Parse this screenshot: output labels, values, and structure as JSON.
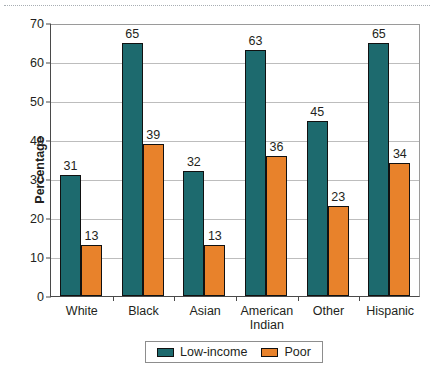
{
  "chart_data": {
    "type": "bar",
    "title": "",
    "xlabel": "",
    "ylabel": "Percentage",
    "ylim": [
      0,
      70
    ],
    "ytick_step": 10,
    "yticks": [
      0,
      10,
      20,
      30,
      40,
      50,
      60,
      70
    ],
    "grid": true,
    "legend_position": "bottom",
    "categories": [
      "White",
      "Black",
      "Asian",
      "American\nIndian",
      "Other",
      "Hispanic"
    ],
    "series": [
      {
        "name": "Low-income",
        "color": "#1d6a6e",
        "values": [
          31,
          65,
          32,
          63,
          45,
          65
        ]
      },
      {
        "name": "Poor",
        "color": "#e8822b",
        "values": [
          13,
          39,
          13,
          36,
          23,
          34
        ]
      }
    ]
  },
  "legend": {
    "items": [
      {
        "label": "Low-income",
        "swatch": "low"
      },
      {
        "label": "Poor",
        "swatch": "poor"
      }
    ]
  },
  "colors": {
    "low_income": "#1d6a6e",
    "poor": "#e8822b",
    "axis": "#4a4a4a",
    "gridline": "#bdbdbd",
    "text": "#231f20",
    "background": "#ffffff"
  }
}
